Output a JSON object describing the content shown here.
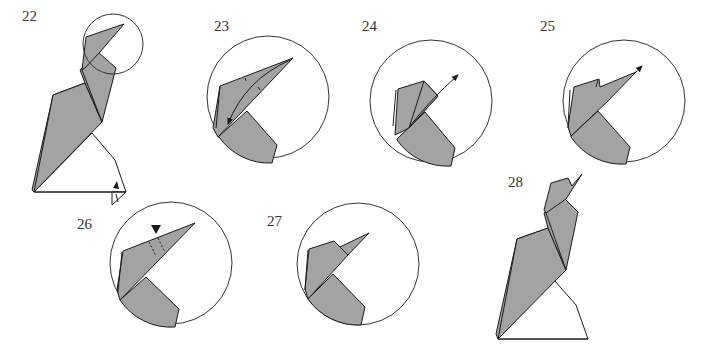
{
  "diagram": {
    "colors": {
      "paper": "#a3a3a3",
      "outline": "#1a1a1a",
      "background": "#ffffff"
    },
    "steps": [
      {
        "number": "22",
        "label": "22",
        "description": "Full model; head area circled; small fold at base right"
      },
      {
        "number": "23",
        "label": "23",
        "description": "Close-up of head; valley fold beak down along arrow"
      },
      {
        "number": "24",
        "label": "24",
        "description": "Close-up; fold beak back up along arrow"
      },
      {
        "number": "25",
        "label": "25",
        "description": "Close-up; pull beak tip outward (arrow)"
      },
      {
        "number": "26",
        "label": "26",
        "description": "Close-up; push in (black triangle) along dashed lines"
      },
      {
        "number": "27",
        "label": "27",
        "description": "Close-up of completed head"
      },
      {
        "number": "28",
        "label": "28",
        "description": "Finished bird model"
      }
    ],
    "symbols": {
      "arrow": "fold-arrow",
      "push_arrow": "push-triangle",
      "dashed": "valley-fold-line"
    }
  }
}
